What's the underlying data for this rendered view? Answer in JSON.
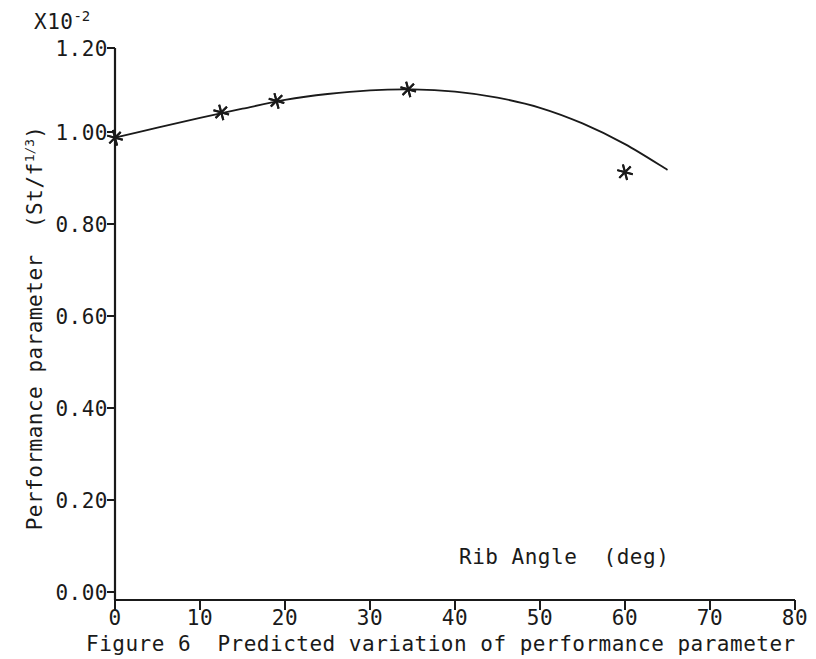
{
  "figure": {
    "caption": "Figure 6  Predicted variation of performance parameter",
    "multiplier_base": "X10",
    "multiplier_exponent": "-2"
  },
  "axes": {
    "y_label_main": "Performance parameter  (St/f",
    "y_label_exponent": "1/3",
    "y_label_tail": ")",
    "x_label": "Rib Angle  (deg)",
    "y_ticks": [
      "0.00",
      "0.20",
      "0.40",
      "0.60",
      "0.80",
      "1.00",
      "1.20"
    ],
    "x_ticks": [
      "0",
      "10",
      "20",
      "30",
      "40",
      "50",
      "60",
      "70",
      "80"
    ]
  },
  "chart_data": {
    "type": "line",
    "title": "Figure 6  Predicted variation of performance parameter",
    "xlabel": "Rib Angle  (deg)",
    "ylabel": "Performance parameter  (St/f^(1/3))",
    "y_multiplier": 0.01,
    "y_multiplier_label": "X10^-2",
    "xlim": [
      0,
      80
    ],
    "ylim": [
      0.0,
      1.2
    ],
    "xticks": [
      0,
      10,
      20,
      30,
      40,
      50,
      60,
      70,
      80
    ],
    "yticks": [
      0.0,
      0.2,
      0.4,
      0.6,
      0.8,
      1.0,
      1.2
    ],
    "grid": false,
    "legend": null,
    "marker": "asterisk",
    "series": [
      {
        "name": "Performance parameter",
        "x": [
          0,
          12.5,
          19,
          34.5,
          60
        ],
        "y": [
          1.005,
          1.06,
          1.085,
          1.11,
          0.93
        ]
      }
    ],
    "curve_x": [
      0,
      5,
      10,
      15,
      20,
      25,
      30,
      35,
      40,
      45,
      50,
      55,
      60,
      65
    ],
    "curve_y": [
      1.005,
      1.027,
      1.048,
      1.068,
      1.087,
      1.1,
      1.108,
      1.11,
      1.105,
      1.092,
      1.07,
      1.036,
      0.991,
      0.935
    ]
  }
}
